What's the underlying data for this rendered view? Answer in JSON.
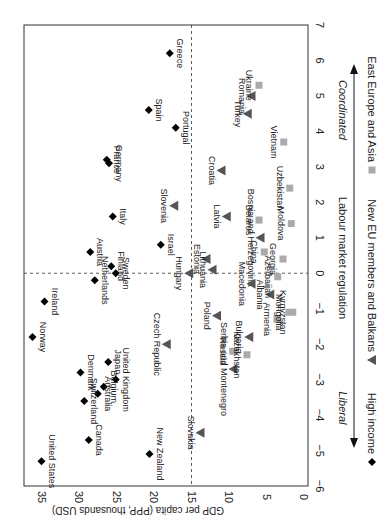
{
  "chart_data": {
    "type": "scatter",
    "orientation_note": "figure is displayed rotated 90 degrees clockwise",
    "title": "",
    "xlabel": "Labour market regulation",
    "ylabel": "GDP per capita (PPP, thousands USD)",
    "xlim": [
      -6,
      7
    ],
    "ylim": [
      0,
      37
    ],
    "x_ticks": [
      -6,
      -5,
      -4,
      -3,
      -2,
      -1,
      0,
      1,
      2,
      3,
      4,
      5,
      6,
      7
    ],
    "y_ticks": [
      0,
      5,
      10,
      15,
      20,
      25,
      30,
      35
    ],
    "reference_lines": {
      "x": 0,
      "y": 15
    },
    "arrow_labels": {
      "left": "Liberal",
      "right": "Coordinated"
    },
    "legend": [
      {
        "name": "High income",
        "marker": "diamond",
        "color": "#000000"
      },
      {
        "name": "New EU members and Balkans",
        "marker": "triangle",
        "color": "#555555"
      },
      {
        "name": "East Europe and Asia",
        "marker": "square",
        "color": "#aaaaaa"
      }
    ],
    "series": [
      {
        "name": "High income",
        "points": [
          {
            "label": "Greece",
            "x": 6.2,
            "y": 17.9
          },
          {
            "label": "Spain",
            "x": 4.6,
            "y": 20.7
          },
          {
            "label": "Portugal",
            "x": 4.1,
            "y": 17.1
          },
          {
            "label": "France",
            "x": 3.2,
            "y": 26.3
          },
          {
            "label": "Germany",
            "x": 3.1,
            "y": 26.0
          },
          {
            "label": "Italy",
            "x": 1.6,
            "y": 25.5
          },
          {
            "label": "Israel",
            "x": 0.8,
            "y": 19.1
          },
          {
            "label": "Austria",
            "x": 0.6,
            "y": 28.5
          },
          {
            "label": "Finland",
            "x": 0.2,
            "y": 25.7
          },
          {
            "label": "Sweden",
            "x": 0.0,
            "y": 25.1
          },
          {
            "label": "Netherlands",
            "x": -0.2,
            "y": 27.9
          },
          {
            "label": "Ireland",
            "x": -0.8,
            "y": 34.6
          },
          {
            "label": "Norway",
            "x": -1.8,
            "y": 36.2
          },
          {
            "label": "Japan",
            "x": -2.5,
            "y": 26.1
          },
          {
            "label": "Denmark",
            "x": -2.8,
            "y": 29.8
          },
          {
            "label": "United Kingdom",
            "x": -3.0,
            "y": 25.1
          },
          {
            "label": "Belgium",
            "x": -3.2,
            "y": 26.7
          },
          {
            "label": "Australia",
            "x": -3.4,
            "y": 27.5
          },
          {
            "label": "Switzerland",
            "x": -3.6,
            "y": 29.3
          },
          {
            "label": "Canada",
            "x": -4.7,
            "y": 28.7
          },
          {
            "label": "New Zealand",
            "x": -5.1,
            "y": 20.6
          },
          {
            "label": "United States",
            "x": -5.3,
            "y": 35.0
          }
        ]
      },
      {
        "name": "New EU members and Balkans",
        "points": [
          {
            "label": "Romania",
            "x": 5.0,
            "y": 7.0
          },
          {
            "label": "Turkey",
            "x": 4.5,
            "y": 7.5
          },
          {
            "label": "Croatia",
            "x": 2.9,
            "y": 11.0
          },
          {
            "label": "Slovenia",
            "x": 1.9,
            "y": 17.3
          },
          {
            "label": "Latvia",
            "x": 1.6,
            "y": 10.3
          },
          {
            "label": "Bosnia and Herzegovina",
            "x": 1.0,
            "y": 5.8
          },
          {
            "label": "Estonia",
            "x": 0.4,
            "y": 13.0
          },
          {
            "label": "Lithuania",
            "x": 0.1,
            "y": 12.2
          },
          {
            "label": "Hungary",
            "x": 0.0,
            "y": 15.3
          },
          {
            "label": "Macedonia",
            "x": -0.3,
            "y": 7.0
          },
          {
            "label": "Albania",
            "x": -0.6,
            "y": 4.5
          },
          {
            "label": "Poland",
            "x": -1.2,
            "y": 11.6
          },
          {
            "label": "Bulgaria",
            "x": -1.8,
            "y": 7.3
          },
          {
            "label": "Czech Republic",
            "x": -2.0,
            "y": 18.3
          },
          {
            "label": "Serbia and Montenegro",
            "x": -2.7,
            "y": 9.4
          },
          {
            "label": "Slovakia",
            "x": -4.5,
            "y": 13.8
          }
        ]
      },
      {
        "name": "East Europe and Asia",
        "points": [
          {
            "label": "Ukraine",
            "x": 5.3,
            "y": 6.0
          },
          {
            "label": "Vietnam",
            "x": 3.7,
            "y": 2.7
          },
          {
            "label": "Uzbekistan",
            "x": 2.4,
            "y": 1.9
          },
          {
            "label": "Belarus",
            "x": 1.5,
            "y": 6.0
          },
          {
            "label": "Moldova",
            "x": 1.4,
            "y": 1.7
          },
          {
            "label": "China",
            "x": 0.6,
            "y": 5.3
          },
          {
            "label": "Georgia",
            "x": 0.4,
            "y": 2.8
          },
          {
            "label": "Azerbaijan",
            "x": -0.1,
            "y": 3.5
          },
          {
            "label": "Armenia",
            "x": -1.3,
            "y": 3.6
          },
          {
            "label": "Mongolia",
            "x": -1.1,
            "y": 2.0
          },
          {
            "label": "Kyrgyzstan",
            "x": -1.1,
            "y": 1.5
          },
          {
            "label": "Russia",
            "x": -2.2,
            "y": 9.5
          },
          {
            "label": "Kazakhstan",
            "x": -2.3,
            "y": 7.6
          }
        ]
      }
    ]
  }
}
